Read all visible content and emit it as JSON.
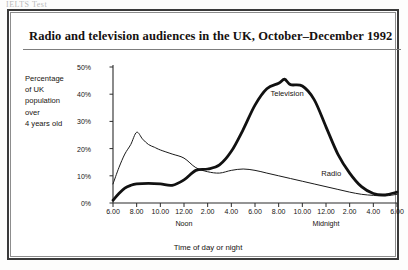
{
  "document": {
    "top_sliver_text": "IELTS Test",
    "title": "Radio and television audiences in the UK, October–December 1992"
  },
  "chart_data": {
    "type": "line",
    "title": "Radio and television audiences in the UK, October–December 1992",
    "xlabel": "Time of day or night",
    "ylabel": "Percentage of UK population over 4 years old",
    "ylabel_lines": [
      "Percentage",
      "of UK",
      "population",
      "over",
      "4 years old"
    ],
    "ylim": [
      0,
      50
    ],
    "yticks": [
      0,
      10,
      20,
      30,
      40,
      50
    ],
    "ytick_labels": [
      "0%",
      "10%",
      "20%",
      "30%",
      "40%",
      "50%"
    ],
    "xlim": [
      6,
      30
    ],
    "xticks": [
      6,
      8,
      10,
      12,
      14,
      16,
      18,
      20,
      22,
      24,
      26,
      28,
      30
    ],
    "xtick_labels": [
      "6.00",
      "8.00",
      "10.00",
      "12.00",
      "2.00",
      "4.00",
      "6.00",
      "8.00",
      "10.00",
      "12.00",
      "2.00",
      "4.00",
      "6.00"
    ],
    "x_anchors": [
      {
        "label": "Noon",
        "x": 12
      },
      {
        "label": "Midnight",
        "x": 24
      }
    ],
    "grid": false,
    "legend": "inline-labels",
    "series": [
      {
        "name": "Radio",
        "style": "thin",
        "color": "#1a1a1a",
        "label_x": 23.6,
        "label_y": 10.6,
        "x": [
          6,
          6.5,
          7,
          7.5,
          8,
          8.5,
          9,
          9.5,
          10,
          11,
          12,
          13,
          14,
          15,
          16,
          17,
          18,
          19,
          20,
          21,
          22,
          23,
          24,
          25,
          26,
          27,
          28,
          29,
          30
        ],
        "values": [
          7.0,
          13.0,
          18.0,
          21.5,
          26.0,
          23.5,
          21.5,
          20.5,
          19.5,
          18.0,
          16.5,
          13.0,
          11.5,
          11.0,
          12.0,
          12.5,
          12.0,
          11.0,
          10.0,
          9.0,
          8.0,
          7.0,
          6.0,
          5.0,
          4.0,
          3.2,
          2.8,
          2.6,
          3.2
        ]
      },
      {
        "name": "Television",
        "style": "thick",
        "color": "#111111",
        "label_x": 19.3,
        "label_y": 40.0,
        "x": [
          6,
          6.5,
          7,
          7.5,
          8,
          9,
          10,
          11,
          12,
          13,
          14,
          15,
          16,
          17,
          18,
          19,
          20,
          20.5,
          21,
          22,
          23,
          24,
          25,
          26,
          27,
          28,
          29,
          30
        ],
        "values": [
          1.0,
          3.5,
          5.5,
          6.5,
          7.0,
          7.2,
          7.0,
          6.5,
          8.5,
          12.0,
          12.5,
          14.0,
          19.0,
          27.0,
          36.0,
          42.0,
          44.0,
          45.5,
          43.5,
          43.0,
          38.0,
          28.0,
          18.0,
          11.0,
          6.0,
          3.5,
          3.0,
          4.0
        ]
      }
    ]
  }
}
